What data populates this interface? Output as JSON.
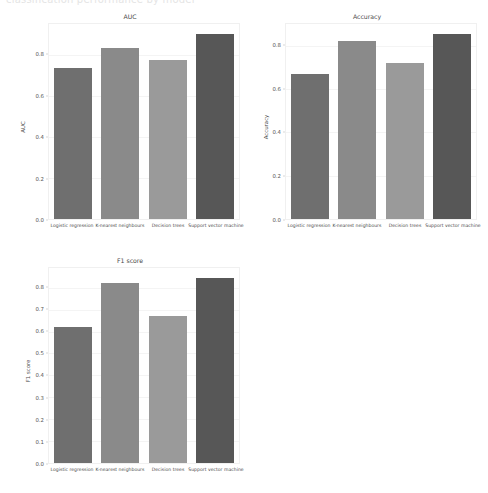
{
  "page": {
    "topnote": "classification performance by model"
  },
  "palette": {
    "bar_colors": [
      "#6f6f6f",
      "#8a8a8a",
      "#9a9a9a",
      "#575757"
    ],
    "grid": "#f4f4f4",
    "frame": "#f0f0f0",
    "text": "#4a4a4a",
    "background": "#ffffff"
  },
  "categories": [
    "Logistic regression",
    "K-nearest neighbours",
    "Decision trees",
    "Support vector machine"
  ],
  "chart_data": [
    {
      "type": "bar",
      "id": "auc",
      "title": "AUC",
      "xlabel": "",
      "ylabel": "AUC",
      "categories": [
        "Logistic regression",
        "K-nearest neighbours",
        "Decision trees",
        "Support vector machine"
      ],
      "values": [
        0.735,
        0.835,
        0.775,
        0.9
      ],
      "ylim": [
        0.0,
        0.95
      ],
      "yticks": [
        0.0,
        0.2,
        0.4,
        0.6,
        0.8
      ],
      "ytick_labels": [
        "0.0",
        "0.2",
        "0.4",
        "0.6",
        "0.8"
      ],
      "grid": true,
      "legend": "none"
    },
    {
      "type": "bar",
      "id": "accuracy",
      "title": "Accuracy",
      "xlabel": "",
      "ylabel": "Accuracy",
      "categories": [
        "Logistic regression",
        "K-nearest neighbours",
        "Decision trees",
        "Support vector machine"
      ],
      "values": [
        0.67,
        0.82,
        0.72,
        0.855
      ],
      "ylim": [
        0.0,
        0.9
      ],
      "yticks": [
        0.0,
        0.2,
        0.4,
        0.6,
        0.8
      ],
      "ytick_labels": [
        "0.0",
        "0.2",
        "0.4",
        "0.6",
        "0.8"
      ],
      "grid": true,
      "legend": "none"
    },
    {
      "type": "bar",
      "id": "f1",
      "title": "F1 score",
      "xlabel": "",
      "ylabel": "F1 score",
      "categories": [
        "Logistic regression",
        "K-nearest neighbours",
        "Decision trees",
        "Support vector machine"
      ],
      "values": [
        0.62,
        0.82,
        0.67,
        0.845
      ],
      "ylim": [
        0.0,
        0.89
      ],
      "yticks": [
        0.0,
        0.1,
        0.2,
        0.3,
        0.4,
        0.5,
        0.6,
        0.7,
        0.8
      ],
      "ytick_labels": [
        "0.0",
        "0.1",
        "0.2",
        "0.3",
        "0.4",
        "0.5",
        "0.6",
        "0.7",
        "0.8"
      ],
      "grid": true,
      "legend": "none"
    }
  ]
}
